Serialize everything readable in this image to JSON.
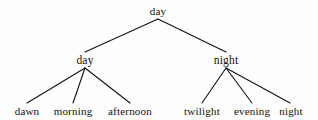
{
  "figure": {
    "kind": "tree-diagram",
    "background_color": "#fefefe",
    "edge_color": "#111111",
    "text_color": "#111111"
  },
  "tree": {
    "root": {
      "label": "day",
      "x": 158,
      "y": 11
    },
    "level2": [
      {
        "label": "day",
        "x": 85,
        "y": 60
      },
      {
        "label": "night",
        "x": 226,
        "y": 60
      }
    ],
    "leaves": [
      {
        "label": "dawn",
        "x": 27,
        "y": 111
      },
      {
        "label": "morning",
        "x": 73,
        "y": 111
      },
      {
        "label": "afternoon",
        "x": 130,
        "y": 111
      },
      {
        "label": "twilight",
        "x": 202,
        "y": 111
      },
      {
        "label": "evening",
        "x": 252,
        "y": 111
      },
      {
        "label": "night",
        "x": 291,
        "y": 111
      }
    ],
    "edges": [
      {
        "from": "root",
        "to": "day",
        "x1": 158,
        "y1": 19,
        "x2": 85,
        "y2": 52
      },
      {
        "from": "root",
        "to": "night",
        "x1": 158,
        "y1": 19,
        "x2": 226,
        "y2": 52
      },
      {
        "from": "day",
        "to": "dawn",
        "x1": 85,
        "y1": 68,
        "x2": 27,
        "y2": 103
      },
      {
        "from": "day",
        "to": "morning",
        "x1": 85,
        "y1": 68,
        "x2": 73,
        "y2": 103
      },
      {
        "from": "day",
        "to": "afternoon",
        "x1": 85,
        "y1": 68,
        "x2": 130,
        "y2": 103
      },
      {
        "from": "night",
        "to": "twilight",
        "x1": 226,
        "y1": 68,
        "x2": 202,
        "y2": 103
      },
      {
        "from": "night",
        "to": "evening",
        "x1": 226,
        "y1": 68,
        "x2": 252,
        "y2": 103
      },
      {
        "from": "night",
        "to": "night-leaf",
        "x1": 226,
        "y1": 68,
        "x2": 290,
        "y2": 103
      }
    ]
  }
}
